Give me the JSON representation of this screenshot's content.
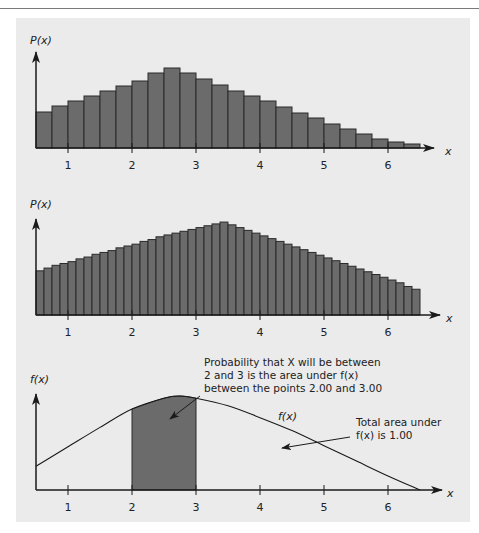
{
  "chart_data": [
    {
      "type": "bar",
      "title": "",
      "ylabel": "P(x)",
      "xlabel": "x",
      "x_ticks": [
        1,
        2,
        3,
        4,
        5,
        6
      ],
      "bin_width": 0.25,
      "x_start": 0.5,
      "values": [
        36,
        42,
        47,
        52,
        57,
        62,
        67,
        75,
        80,
        75,
        69,
        63,
        57,
        52,
        47,
        41,
        35,
        30,
        24,
        19,
        14,
        9,
        6,
        4
      ],
      "ylim": [
        0,
        100
      ],
      "grid": false
    },
    {
      "type": "bar",
      "title": "",
      "ylabel": "P(x)",
      "xlabel": "x",
      "x_ticks": [
        1,
        2,
        3,
        4,
        5,
        6
      ],
      "bin_width": 0.125,
      "x_start": 0.5,
      "values": [
        48,
        51,
        54,
        56,
        58,
        61,
        63,
        66,
        68,
        70,
        73,
        75,
        77,
        80,
        82,
        85,
        87,
        89,
        91,
        93,
        95,
        97,
        99,
        101,
        98,
        95,
        92,
        89,
        86,
        83,
        80,
        77,
        74,
        71,
        68,
        65,
        62,
        59,
        56,
        53,
        50,
        47,
        44,
        41,
        38,
        35,
        31,
        28
      ],
      "ylim": [
        0,
        120
      ],
      "grid": false
    },
    {
      "type": "area",
      "title": "",
      "ylabel": "f(x)",
      "xlabel": "x",
      "x_ticks": [
        1,
        2,
        3,
        4,
        5,
        6
      ],
      "curve_label": "f(x)",
      "curve": [
        [
          0.5,
          22
        ],
        [
          1.0,
          40
        ],
        [
          1.5,
          58
        ],
        [
          2.0,
          75
        ],
        [
          2.5,
          85
        ],
        [
          2.75,
          87
        ],
        [
          3.0,
          85
        ],
        [
          3.5,
          78
        ],
        [
          4.0,
          67
        ],
        [
          4.5,
          55
        ],
        [
          5.0,
          41
        ],
        [
          5.5,
          27
        ],
        [
          6.0,
          13
        ],
        [
          6.5,
          0
        ]
      ],
      "shaded_range": [
        2.0,
        3.0
      ],
      "annotations": [
        "Probability that X will be between 2 and 3 is the area under f(x) between the points 2.00 and 3.00",
        "Total area under f(x) is 1.00"
      ]
    }
  ],
  "charts": {
    "top": {
      "ylabel": "P(x)",
      "xlabel": "x"
    },
    "middle": {
      "ylabel": "P(x)",
      "xlabel": "x"
    },
    "bottom": {
      "ylabel": "f(x)",
      "xlabel": "x",
      "curve_label": "f(x)",
      "annotation_1_lines": [
        "Probability that X will be between",
        "2 and 3 is the area under f(x)",
        "between the points 2.00 and 3.00"
      ],
      "annotation_2_lines": [
        "Total area under",
        "f(x) is 1.00"
      ]
    },
    "tick_labels": [
      "1",
      "2",
      "3",
      "4",
      "5",
      "6"
    ]
  },
  "colors": {
    "bar_fill": "#6b6b6b",
    "bar_stroke": "#2a2a2a",
    "panel_bg": "#ebebeb",
    "axis": "#1a1a1a"
  }
}
